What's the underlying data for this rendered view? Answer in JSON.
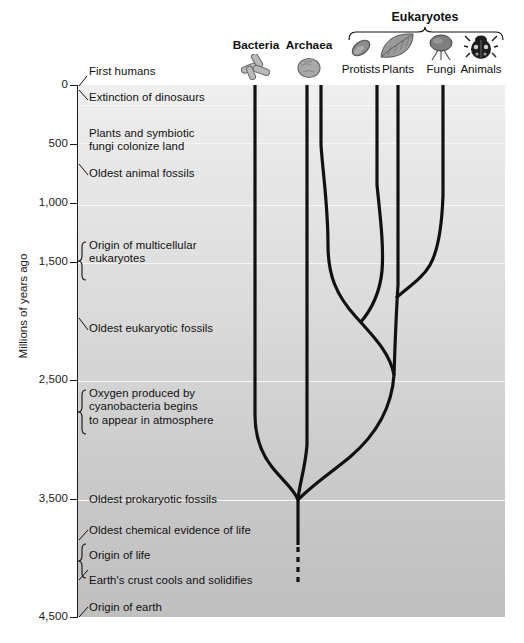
{
  "figure": {
    "axis_title": "Millions of years ago"
  },
  "axis": {
    "label": "Millions of years ago",
    "ticks": [
      {
        "value": 0,
        "label": "0"
      },
      {
        "value": 500,
        "label": "500"
      },
      {
        "value": 1000,
        "label": "1,000"
      },
      {
        "value": 1500,
        "label": "1,500"
      },
      {
        "value": 2500,
        "label": "2,500"
      },
      {
        "value": 3500,
        "label": "3,500"
      },
      {
        "value": 4500,
        "label": "4,500"
      }
    ],
    "range": [
      0,
      4500
    ],
    "direction": "inverted"
  },
  "events": [
    {
      "text": "First humans",
      "value": 0,
      "bracket": false
    },
    {
      "text": "Extinction of dinosaurs",
      "value": 65,
      "bracket": false
    },
    {
      "text": "Plants and symbiotic\nfungi colonize land",
      "value": 475,
      "bracket": false
    },
    {
      "text": "Oldest animal fossils",
      "value": 700,
      "bracket": false
    },
    {
      "text": "Origin of multicellular\neukaryotes",
      "value": 1500,
      "bracket": true
    },
    {
      "text": "Oldest eukaryotic fossils",
      "value": 2100,
      "bracket": false
    },
    {
      "text": "Oxygen produced by\ncyanobacteria begins\nto appear in atmosphere",
      "value": 2700,
      "bracket": true
    },
    {
      "text": "Oldest prokaryotic fossils",
      "value": 3500,
      "bracket": false
    },
    {
      "text": "Oldest chemical evidence of life",
      "value": 3800,
      "bracket": false
    },
    {
      "text": "Origin of life",
      "value": 4000,
      "bracket": true
    },
    {
      "text": "Earth's crust cools and solidifies",
      "value": 4200,
      "bracket": false
    },
    {
      "text": "Origin of earth",
      "value": 4500,
      "bracket": false
    }
  ],
  "taxa": [
    {
      "name": "Bacteria",
      "icon": "bacteria-rods-icon",
      "bold": true,
      "x": 255,
      "group": null
    },
    {
      "name": "Archaea",
      "icon": "archaea-cell-icon",
      "bold": true,
      "x": 308,
      "group": null
    },
    {
      "name": "Protists",
      "icon": "protist-icon",
      "bold": false,
      "x": 360,
      "group": "Eukaryotes"
    },
    {
      "name": "Plants",
      "icon": "plant-leaf-icon",
      "bold": false,
      "x": 397,
      "group": "Eukaryotes"
    },
    {
      "name": "Fungi",
      "icon": "fungus-mushroom-icon",
      "bold": false,
      "x": 440,
      "group": "Eukaryotes"
    },
    {
      "name": "Animals",
      "icon": "animal-beetle-icon",
      "bold": false,
      "x": 480,
      "group": "Eukaryotes"
    }
  ],
  "group_label": {
    "text": "Eukaryotes",
    "center_x": 425,
    "span": [
      348,
      503
    ]
  },
  "tree": {
    "root_value": 4050,
    "dashed_root_bottom_value": 4400,
    "basal_split_value": 3500,
    "eukaryote_origin_value": 2200,
    "fungi_animal_split_value": 1700,
    "plant_protist_split_value": 3000,
    "line_color": "#111111",
    "dashed": true
  },
  "colors": {
    "plot_top": "#efefef",
    "plot_bottom": "#bfbfbf",
    "gridline": "#f7f7f7",
    "ink": "#111111"
  }
}
